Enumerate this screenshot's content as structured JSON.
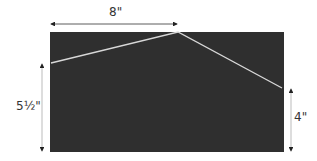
{
  "diagram": {
    "panel_color": "#2f2f2f",
    "line_color": "#d8d8d8",
    "dimensions": {
      "top_width": "8\"",
      "left_height": "5½\"",
      "right_height": "4\""
    }
  }
}
